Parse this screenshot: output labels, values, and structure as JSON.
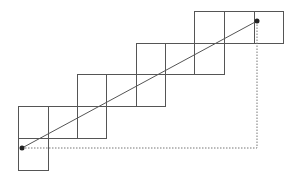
{
  "diagram": {
    "type": "staircase-grid-with-diagonal",
    "colors": {
      "background": "#ffffff",
      "grid_stroke": "#555555",
      "line": "#555555",
      "dotted": "#777777",
      "point": "#222222"
    },
    "cells": [
      {
        "x": 18,
        "y": 138,
        "w": 30,
        "h": 32
      },
      {
        "x": 18,
        "y": 106,
        "w": 30,
        "h": 32
      },
      {
        "x": 48,
        "y": 106,
        "w": 29,
        "h": 32
      },
      {
        "x": 77,
        "y": 106,
        "w": 29,
        "h": 32
      },
      {
        "x": 77,
        "y": 74,
        "w": 29,
        "h": 32
      },
      {
        "x": 106,
        "y": 74,
        "w": 30,
        "h": 32
      },
      {
        "x": 136,
        "y": 74,
        "w": 29,
        "h": 32
      },
      {
        "x": 136,
        "y": 43,
        "w": 29,
        "h": 31
      },
      {
        "x": 165,
        "y": 43,
        "w": 29,
        "h": 31
      },
      {
        "x": 194,
        "y": 43,
        "w": 30,
        "h": 31
      },
      {
        "x": 194,
        "y": 11,
        "w": 30,
        "h": 32
      },
      {
        "x": 224,
        "y": 11,
        "w": 30,
        "h": 32
      },
      {
        "x": 254,
        "y": 11,
        "w": 29,
        "h": 32
      }
    ],
    "line": {
      "x1": 22,
      "y1": 148,
      "x2": 257,
      "y2": 21
    },
    "start_point": {
      "x": 22,
      "y": 148,
      "r": 2.5
    },
    "end_point": {
      "x": 257,
      "y": 21,
      "r": 2.5
    },
    "dotted_path": [
      [
        22,
        148
      ],
      [
        257,
        148
      ],
      [
        257,
        21
      ]
    ]
  }
}
